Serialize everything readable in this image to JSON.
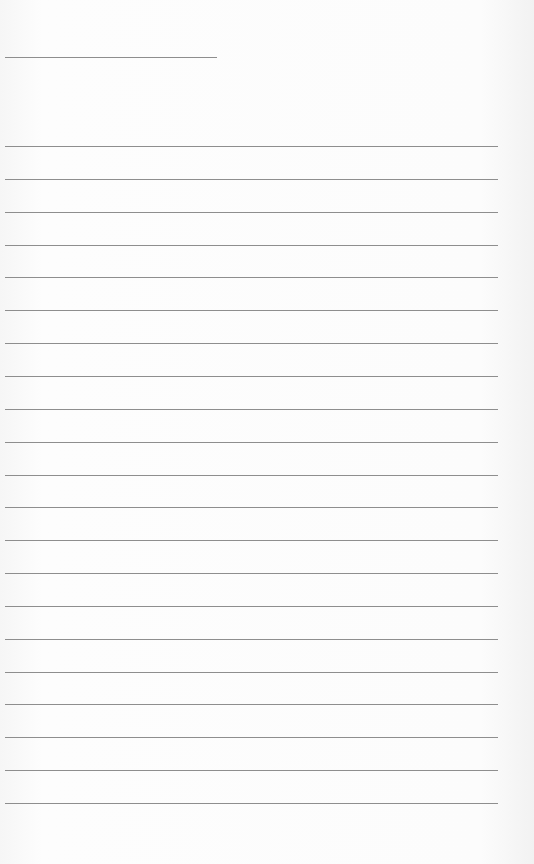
{
  "document": {
    "type": "lined-paper",
    "header_line": {
      "top": 57,
      "left": 5,
      "width": 212
    },
    "lines": {
      "count": 21,
      "first_top": 146,
      "spacing": 32.85,
      "left": 5,
      "width": 493,
      "color": "#8e8e8e"
    },
    "background_color": "#fafafa"
  }
}
